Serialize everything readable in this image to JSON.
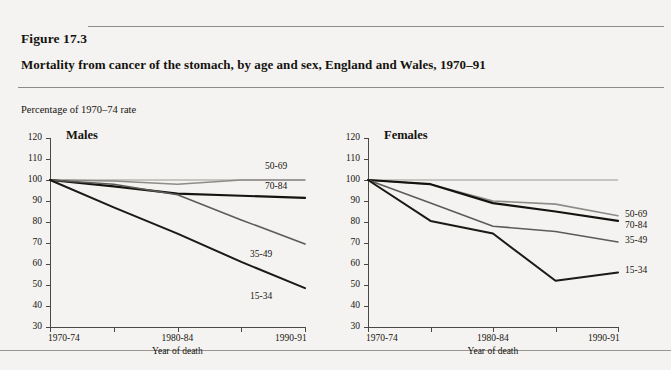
{
  "figure": {
    "number_label": "Figure 17.3",
    "title": "Mortality from cancer of the stomach, by age and sex, England and Wales, 1970–91",
    "y_caption": "Percentage of 1970–74 rate"
  },
  "chart_data": [
    {
      "type": "line",
      "title": "Males",
      "xlabel": "Year of death",
      "ylabel": "Percentage of 1970–74 rate",
      "ylim": [
        30,
        120
      ],
      "ytick_labels": [
        "120",
        "110",
        "100",
        "90",
        "80",
        "70",
        "60",
        "50",
        "40",
        "30"
      ],
      "yticks": [
        120,
        110,
        100,
        90,
        80,
        70,
        60,
        50,
        40,
        30
      ],
      "grid": false,
      "legend_position": "right-inline",
      "x": [
        0,
        1,
        2,
        3,
        4
      ],
      "categories": [
        "1970-74",
        "1975-79",
        "1980-84",
        "1985-89",
        "1990-91"
      ],
      "xtick_labels": [
        "1970-74",
        "",
        "1980-84",
        "",
        "1990-91"
      ],
      "series": [
        {
          "name": "50-69",
          "values": [
            100,
            99.5,
            98,
            100,
            100
          ],
          "color": "#8e8b88",
          "width": 1.6
        },
        {
          "name": "70-84",
          "values": [
            100,
            97,
            93.5,
            92.5,
            91.5
          ],
          "color": "#15130f",
          "width": 2.2
        },
        {
          "name": "35-49",
          "values": [
            100,
            98,
            93,
            81,
            69.5
          ],
          "color": "#5d5b58",
          "width": 1.6
        },
        {
          "name": "15-34",
          "values": [
            100,
            87,
            74.5,
            61,
            48.5
          ],
          "color": "#1b1916",
          "width": 2.0
        }
      ]
    },
    {
      "type": "line",
      "title": "Females",
      "xlabel": "Year of death",
      "ylabel": "Percentage of 1970–74 rate",
      "ylim": [
        30,
        120
      ],
      "ytick_labels": [
        "120",
        "110",
        "100",
        "90",
        "80",
        "70",
        "60",
        "50",
        "40",
        "30"
      ],
      "yticks": [
        120,
        110,
        100,
        90,
        80,
        70,
        60,
        50,
        40,
        30
      ],
      "grid": false,
      "legend_position": "right-inline",
      "x": [
        0,
        1,
        2,
        3,
        4
      ],
      "categories": [
        "1970-74",
        "1975-79",
        "1980-84",
        "1985-89",
        "1990-91"
      ],
      "xtick_labels": [
        "1970-74",
        "",
        "1980-84",
        "",
        "1990-91"
      ],
      "series": [
        {
          "name": "50-69",
          "values": [
            100,
            98,
            90,
            88.5,
            83
          ],
          "color": "#8e8b88",
          "width": 1.6
        },
        {
          "name": "70-84",
          "values": [
            100,
            98,
            89,
            85,
            80.5
          ],
          "color": "#15130f",
          "width": 2.2
        },
        {
          "name": "35-49",
          "values": [
            100,
            89,
            78,
            75.5,
            70.5
          ],
          "color": "#5d5b58",
          "width": 1.6
        },
        {
          "name": "15-34",
          "values": [
            100,
            80.5,
            74.5,
            52,
            56
          ],
          "color": "#1b1916",
          "width": 2.0
        }
      ]
    }
  ],
  "reference_line": {
    "value": 100,
    "color": "#9a9793"
  }
}
